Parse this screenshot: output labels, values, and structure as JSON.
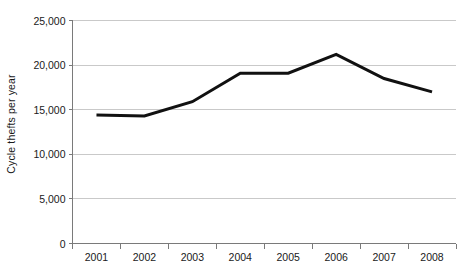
{
  "chart_data": {
    "type": "line",
    "title": "",
    "xlabel": "",
    "ylabel": "Cycle thefts per year",
    "categories": [
      "2001",
      "2002",
      "2003",
      "2004",
      "2005",
      "2006",
      "2007",
      "2008"
    ],
    "values": [
      14400,
      14300,
      15900,
      19100,
      19100,
      21200,
      18500,
      17000
    ],
    "series": [
      {
        "name": "Cycle thefts per year",
        "values": [
          14400,
          14300,
          15900,
          19100,
          19100,
          21200,
          18500,
          17000
        ]
      }
    ],
    "ylim": [
      0,
      25000
    ],
    "y_ticks": [
      0,
      5000,
      10000,
      15000,
      20000,
      25000
    ],
    "y_tick_labels": [
      "0",
      "5,000",
      "10,000",
      "15,000",
      "20,000",
      "25,000"
    ],
    "x_tick_labels": [
      "2001",
      "2002",
      "2003",
      "2004",
      "2005",
      "2006",
      "2007",
      "2008"
    ],
    "grid": true,
    "grid_axis": "y",
    "legend": false,
    "legend_position": "none",
    "line_color": "#111111",
    "line_width": 3,
    "grid_color": "#c9c9c9",
    "axis_color": "#7a7a7a",
    "background_color": "#ffffff",
    "markers": false,
    "annotations": []
  },
  "axis": {
    "y_title": "Cycle thefts per year"
  }
}
